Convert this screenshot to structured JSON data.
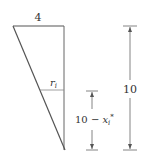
{
  "diagram": {
    "type": "triangle-cross-section",
    "colors": {
      "line": "#555555",
      "thin_line": "#888888",
      "text": "#333333",
      "background": "#ffffff"
    },
    "top_width_label": "4",
    "radius_label": {
      "base": "r",
      "subscript": "i"
    },
    "partial_height_label": {
      "prefix": "10 − ",
      "var": "x",
      "subscript": "i",
      "superscript": "*"
    },
    "total_height_label": "10"
  }
}
